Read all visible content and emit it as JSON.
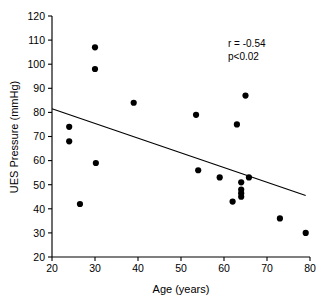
{
  "chart_data": {
    "type": "scatter",
    "title": "",
    "xlabel": "Age (years)",
    "ylabel": "UES Pressure (mmHg)",
    "xlim": [
      20,
      80
    ],
    "ylim": [
      20,
      120
    ],
    "xticks": [
      20,
      30,
      40,
      50,
      60,
      70,
      80
    ],
    "yticks": [
      20,
      30,
      40,
      50,
      60,
      70,
      80,
      90,
      100,
      110,
      120
    ],
    "xtick_labels": [
      "20",
      "30",
      "40",
      "50",
      "60",
      "70",
      "80"
    ],
    "ytick_labels": [
      "20",
      "30",
      "40",
      "50",
      "60",
      "70",
      "80",
      "90",
      "100",
      "110",
      "120"
    ],
    "grid": false,
    "legend": null,
    "marker": "filled-circle",
    "marker_color": "#000000",
    "points": [
      {
        "x": 24.0,
        "y": 74
      },
      {
        "x": 24.0,
        "y": 68
      },
      {
        "x": 26.5,
        "y": 42
      },
      {
        "x": 30.0,
        "y": 107
      },
      {
        "x": 30.0,
        "y": 98
      },
      {
        "x": 30.2,
        "y": 59
      },
      {
        "x": 39.0,
        "y": 84
      },
      {
        "x": 53.5,
        "y": 79
      },
      {
        "x": 54.0,
        "y": 56
      },
      {
        "x": 59.0,
        "y": 53
      },
      {
        "x": 62.0,
        "y": 43
      },
      {
        "x": 63.0,
        "y": 75
      },
      {
        "x": 64.0,
        "y": 51
      },
      {
        "x": 64.0,
        "y": 48
      },
      {
        "x": 64.0,
        "y": 46.5
      },
      {
        "x": 64.0,
        "y": 45
      },
      {
        "x": 65.0,
        "y": 87
      },
      {
        "x": 65.8,
        "y": 53
      },
      {
        "x": 73.0,
        "y": 36
      },
      {
        "x": 79.0,
        "y": 30
      }
    ],
    "fit_line": {
      "x0": 20.0,
      "y0": 81.5,
      "x1": 79.0,
      "y1": 45.5
    },
    "annotations": {
      "correlation": "r = -0.54",
      "pvalue": "p<0.02"
    }
  }
}
